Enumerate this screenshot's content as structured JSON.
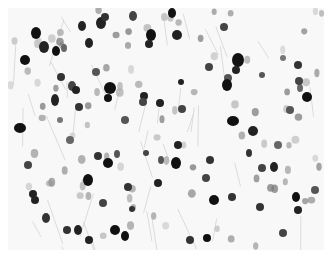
{
  "image": {
    "kind": "grayscale micrograph of stained cell nuclei",
    "background": "#f8f8f8",
    "fiber_color": "#c8c8c8",
    "nuclei": [
      [
        36,
        33,
        5,
        6,
        "#111"
      ],
      [
        44,
        47,
        5,
        6,
        "#222"
      ],
      [
        25,
        60,
        5,
        5,
        "#111"
      ],
      [
        82,
        26,
        4,
        5,
        "#222"
      ],
      [
        101,
        23,
        5,
        6,
        "#222"
      ],
      [
        105,
        17,
        4,
        4,
        "#333"
      ],
      [
        133,
        16,
        4,
        5,
        "#444"
      ],
      [
        151,
        35,
        5,
        6,
        "#111"
      ],
      [
        149,
        44,
        4,
        4,
        "#222"
      ],
      [
        89,
        43,
        4,
        5,
        "#222"
      ],
      [
        56,
        51,
        4,
        5,
        "#111"
      ],
      [
        64,
        48,
        3,
        4,
        "#666"
      ],
      [
        61,
        77,
        4,
        4,
        "#333"
      ],
      [
        72,
        86,
        4,
        5,
        "#444"
      ],
      [
        76,
        90,
        4,
        4,
        "#222"
      ],
      [
        110,
        88,
        6,
        6,
        "#111"
      ],
      [
        108,
        98,
        4,
        4,
        "#111"
      ],
      [
        96,
        72,
        4,
        4,
        "#555"
      ],
      [
        55,
        100,
        4,
        6,
        "#222"
      ],
      [
        79,
        107,
        4,
        4,
        "#333"
      ],
      [
        20,
        128,
        6,
        5,
        "#111"
      ],
      [
        144,
        96,
        4,
        4,
        "#222"
      ],
      [
        160,
        103,
        4,
        4,
        "#222"
      ],
      [
        143,
        102,
        4,
        4,
        "#444"
      ],
      [
        172,
        13,
        4,
        5,
        "#111"
      ],
      [
        177,
        35,
        5,
        5,
        "#222"
      ],
      [
        224,
        27,
        4,
        4,
        "#444"
      ],
      [
        238,
        60,
        6,
        7,
        "#111"
      ],
      [
        236,
        70,
        4,
        4,
        "#222"
      ],
      [
        228,
        78,
        4,
        4,
        "#555"
      ],
      [
        227,
        85,
        5,
        6,
        "#111"
      ],
      [
        209,
        67,
        4,
        4,
        "#444"
      ],
      [
        181,
        82,
        3,
        3,
        "#222"
      ],
      [
        182,
        109,
        4,
        4,
        "#444"
      ],
      [
        233,
        121,
        6,
        5,
        "#111"
      ],
      [
        262,
        75,
        3,
        3,
        "#555"
      ],
      [
        298,
        65,
        4,
        4,
        "#333"
      ],
      [
        307,
        97,
        5,
        5,
        "#111"
      ],
      [
        300,
        88,
        3,
        4,
        "#666"
      ],
      [
        253,
        131,
        5,
        5,
        "#222"
      ],
      [
        299,
        81,
        4,
        4,
        "#444"
      ],
      [
        283,
        58,
        3,
        3,
        "#777"
      ],
      [
        176,
        163,
        5,
        6,
        "#111"
      ],
      [
        178,
        145,
        4,
        4,
        "#222"
      ],
      [
        210,
        160,
        4,
        4,
        "#333"
      ],
      [
        232,
        197,
        4,
        4,
        "#333"
      ],
      [
        214,
        200,
        5,
        5,
        "#111"
      ],
      [
        206,
        178,
        4,
        4,
        "#444"
      ],
      [
        249,
        153,
        3,
        4,
        "#333"
      ],
      [
        262,
        168,
        4,
        4,
        "#444"
      ],
      [
        274,
        167,
        4,
        5,
        "#222"
      ],
      [
        296,
        197,
        4,
        5,
        "#111"
      ],
      [
        298,
        210,
        4,
        4,
        "#222"
      ],
      [
        260,
        207,
        4,
        4,
        "#333"
      ],
      [
        207,
        238,
        4,
        4,
        "#111"
      ],
      [
        315,
        190,
        4,
        4,
        "#555"
      ],
      [
        283,
        233,
        4,
        4,
        "#444"
      ],
      [
        190,
        240,
        4,
        4,
        "#333"
      ],
      [
        88,
        180,
        5,
        6,
        "#111"
      ],
      [
        108,
        163,
        5,
        5,
        "#111"
      ],
      [
        98,
        156,
        4,
        4,
        "#333"
      ],
      [
        117,
        154,
        3,
        4,
        "#555"
      ],
      [
        35,
        200,
        4,
        4,
        "#222"
      ],
      [
        46,
        218,
        4,
        5,
        "#333"
      ],
      [
        67,
        230,
        4,
        4,
        "#333"
      ],
      [
        78,
        230,
        4,
        5,
        "#222"
      ],
      [
        89,
        240,
        4,
        4,
        "#222"
      ],
      [
        115,
        230,
        5,
        5,
        "#111"
      ],
      [
        125,
        236,
        4,
        5,
        "#111"
      ],
      [
        103,
        203,
        4,
        4,
        "#444"
      ],
      [
        132,
        209,
        3,
        3,
        "#333"
      ],
      [
        128,
        187,
        4,
        4,
        "#333"
      ],
      [
        28,
        165,
        4,
        4,
        "#444"
      ],
      [
        33,
        194,
        4,
        4,
        "#222"
      ],
      [
        146,
        153,
        3,
        3,
        "#444"
      ],
      [
        158,
        183,
        4,
        4,
        "#222"
      ],
      [
        161,
        160,
        3,
        4,
        "#555"
      ],
      [
        70,
        140,
        4,
        4,
        "#666"
      ],
      [
        125,
        120,
        4,
        4,
        "#555"
      ],
      [
        60,
        120,
        3,
        3,
        "#777"
      ],
      [
        290,
        110,
        4,
        4,
        "#555"
      ],
      [
        278,
        145,
        4,
        4,
        "#666"
      ]
    ]
  }
}
